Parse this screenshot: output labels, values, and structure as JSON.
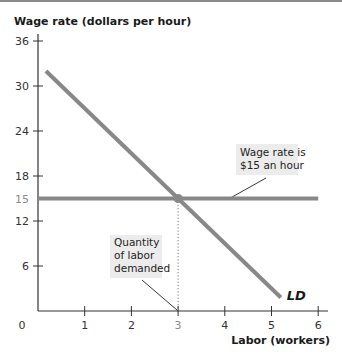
{
  "chart_data": {
    "type": "line",
    "title": "",
    "ylabel": "Wage rate (dollars per hour)",
    "xlabel": "Labor (workers)",
    "xlim": [
      0,
      6.2
    ],
    "ylim": [
      0,
      36
    ],
    "grid": false,
    "x_ticks": [
      {
        "value": 0,
        "label": "0",
        "highlight": false
      },
      {
        "value": 1,
        "label": "1",
        "highlight": false
      },
      {
        "value": 2,
        "label": "2",
        "highlight": false
      },
      {
        "value": 3,
        "label": "3",
        "highlight": true
      },
      {
        "value": 4,
        "label": "4",
        "highlight": false
      },
      {
        "value": 5,
        "label": "5",
        "highlight": false
      },
      {
        "value": 6,
        "label": "6",
        "highlight": false
      }
    ],
    "y_ticks": [
      {
        "value": 6,
        "label": "6",
        "highlight": false
      },
      {
        "value": 12,
        "label": "12",
        "highlight": false
      },
      {
        "value": 15,
        "label": "15",
        "highlight": true
      },
      {
        "value": 18,
        "label": "18",
        "highlight": false
      },
      {
        "value": 24,
        "label": "24",
        "highlight": false
      },
      {
        "value": 30,
        "label": "30",
        "highlight": false
      },
      {
        "value": 36,
        "label": "36",
        "highlight": false
      }
    ],
    "series": [
      {
        "name": "LD",
        "kind": "labor-demand",
        "points": [
          [
            0.17,
            32
          ],
          [
            5.2,
            1.8
          ]
        ],
        "color": "#888888"
      },
      {
        "name": "Wage rate",
        "kind": "horizontal",
        "points": [
          [
            0,
            15
          ],
          [
            6.0,
            15
          ]
        ],
        "color": "#888888"
      }
    ],
    "equilibrium": {
      "x": 3,
      "y": 15,
      "color": "#888888"
    },
    "annotations": [
      {
        "id": "wage",
        "lines": [
          "Wage rate is",
          "$15 an hour"
        ],
        "target": [
          4.1,
          15
        ]
      },
      {
        "id": "qty",
        "lines": [
          "Quantity",
          "of labor",
          "demanded"
        ],
        "target": [
          3,
          0
        ]
      }
    ],
    "curve_label": "LD"
  }
}
